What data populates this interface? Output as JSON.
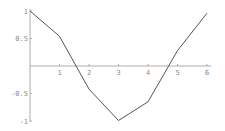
{
  "chart_data": {
    "type": "line",
    "title": "",
    "xlabel": "",
    "ylabel": "",
    "x": [
      0,
      1,
      2,
      3,
      4,
      5,
      6
    ],
    "series": [
      {
        "name": "cos(x) sampled",
        "values": [
          1.0,
          0.54,
          -0.42,
          -0.99,
          -0.65,
          0.28,
          0.96
        ]
      }
    ],
    "xlim": [
      0,
      6.15
    ],
    "ylim": [
      -1,
      1
    ],
    "x_ticks": [
      1,
      2,
      3,
      4,
      5,
      6
    ],
    "x_tick_labels": [
      "1",
      "2",
      "3",
      "4",
      "5",
      "6"
    ],
    "y_ticks": [
      1,
      0.5,
      -0.5,
      -1
    ],
    "y_tick_labels": [
      "1",
      "0.5",
      "-0.5",
      "-1"
    ],
    "grid": false,
    "legend": null,
    "colors": {
      "line": "#555555",
      "axis": "#9a9a9a",
      "labels": "#8a8a8a"
    }
  }
}
